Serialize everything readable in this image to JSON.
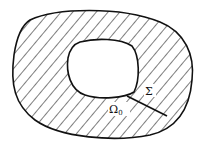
{
  "figure": {
    "labels": {
      "sigma": "Σ",
      "omega": "Ω",
      "omega_sub": "0"
    },
    "colors": {
      "stroke": "#111111",
      "background": "#ffffff"
    },
    "elements": [
      "outer-boundary",
      "inner-hole",
      "hatched-region",
      "cut-line-sigma"
    ]
  }
}
